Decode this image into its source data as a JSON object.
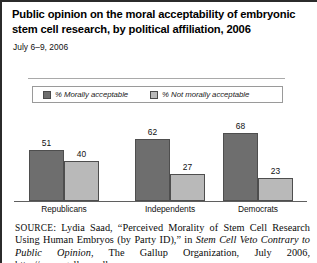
{
  "figure": {
    "title": "Public opinion on the moral acceptability of embryonic stem cell research, by political affiliation, 2006",
    "subtitle": "July 6–9, 2006"
  },
  "legend": {
    "items": [
      {
        "label": "% Morally acceptable",
        "color": "#6e6e6e",
        "swatch_name": "legend-swatch-morally-acceptable"
      },
      {
        "label": "% Not morally acceptable",
        "color": "#b9b9b9",
        "swatch_name": "legend-swatch-not-morally-acceptable"
      }
    ]
  },
  "source": {
    "prefix": "SOURCE",
    "text_1": ": Lydia Saad, “Perceived Morality of Stem Cell Research Using Human Embryos (by Party ID),” in ",
    "italic_title": "Stem Cell Veto Contrary to Public Opinion",
    "text_2": ", The Gallup Organization, July 2006, http://www.gallup.poll"
  },
  "chart_data": {
    "type": "bar",
    "title": "Public opinion on the moral acceptability of embryonic stem cell research, by political affiliation, 2006",
    "subtitle": "July 6–9, 2006",
    "xlabel": "",
    "ylabel": "",
    "ylim": [
      0,
      80
    ],
    "grid": false,
    "legend_position": "top",
    "categories": [
      "Republicans",
      "Independents",
      "Democrats"
    ],
    "series": [
      {
        "name": "% Morally acceptable",
        "color": "#6e6e6e",
        "values": [
          51,
          62,
          68
        ]
      },
      {
        "name": "% Not morally acceptable",
        "color": "#b9b9b9",
        "values": [
          40,
          27,
          23
        ]
      }
    ]
  }
}
